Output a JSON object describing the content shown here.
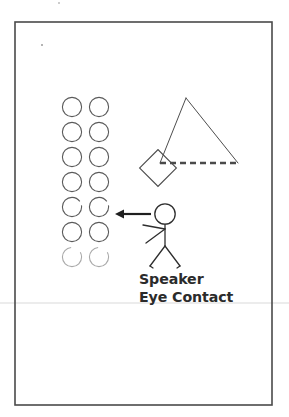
{
  "page": {
    "kind": "scanned-handout-page",
    "width": 289,
    "height": 417,
    "background_color": "#ffffff",
    "ink_color": "#3a3a3a",
    "caption_color": "#2b2b2b",
    "border": {
      "name": "page-border-frame",
      "x": 15,
      "y": 22,
      "width": 257,
      "height": 383,
      "stroke_color": "#4a4a4a",
      "stroke_width": 1.6
    },
    "scan_artifacts": {
      "horizontal_line_y": 303,
      "horizontal_line_color": "#e6e6e6",
      "speck_inner": {
        "x": 41,
        "y": 44
      },
      "speck_outer": {
        "x": 58,
        "y": 2
      }
    }
  },
  "caption": {
    "line1": "Speaker",
    "line2": "Eye Contact"
  },
  "diagram": {
    "audience": {
      "label": "audience-circle-grid",
      "rows": 7,
      "columns": 2,
      "circle_radius": 9.6,
      "column_x": [
        72,
        99
      ],
      "row_y": [
        107,
        132,
        157,
        182,
        207,
        232,
        257
      ],
      "stroke_color": "#5a5a5a",
      "stroke_width": 1.1,
      "faded_last_row": true,
      "faded_stroke_color": "#9a9a9a"
    },
    "arrow": {
      "label": "eye-contact-arrow",
      "direction": "left",
      "tail_x": 151,
      "head_x": 115,
      "y": 214,
      "stroke_color": "#1f1f1f",
      "stroke_width": 2.2
    },
    "speaker_figure": {
      "label": "speaker-stick-figure",
      "head": {
        "cx": 165,
        "cy": 214,
        "r": 10.2
      },
      "torso": {
        "x1": 165,
        "y1": 224.5,
        "x2": 165,
        "y2": 246
      },
      "arm_upper": {
        "x1": 165,
        "y1": 229,
        "x2": 143,
        "y2": 225
      },
      "arm_lower": {
        "x1": 165,
        "y1": 229,
        "x2": 146,
        "y2": 243
      },
      "leg_left": {
        "x1": 165,
        "y1": 246,
        "x2": 150,
        "y2": 266
      },
      "leg_right": {
        "x1": 165,
        "y1": 246,
        "x2": 180,
        "y2": 266
      },
      "foot_left": {
        "x1": 150,
        "y1": 266,
        "x2": 153,
        "y2": 268
      },
      "foot_right": {
        "x1": 180,
        "y1": 266,
        "x2": 177,
        "y2": 268
      },
      "stroke_color": "#2e2e2e",
      "stroke_width": 1.3
    },
    "triangle": {
      "label": "sightline-triangle",
      "apex": {
        "x": 186,
        "y": 98
      },
      "left_base": {
        "x": 160,
        "y": 163
      },
      "right_base": {
        "x": 238,
        "y": 163
      },
      "stroke_color": "#4d4d4d",
      "stroke_width": 1.0,
      "base_edge": {
        "style": "dashed",
        "stroke_color": "#4a4a4a",
        "stroke_width": 2.6,
        "dash_pattern": "6 4"
      }
    },
    "podium": {
      "label": "podium-diamond",
      "center": {
        "x": 158,
        "y": 168
      },
      "half_size": 13,
      "rotation_degrees": 45,
      "stroke_color": "#4d4d4d",
      "stroke_width": 1.1
    }
  }
}
